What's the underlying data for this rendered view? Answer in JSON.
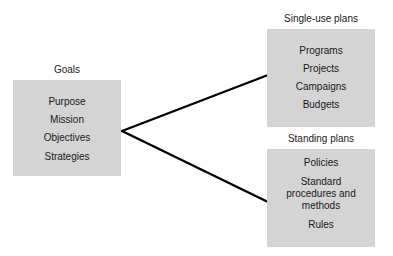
{
  "goals": {
    "title": "Goals",
    "items": [
      "Purpose",
      "Mission",
      "Objectives",
      "Strategies"
    ]
  },
  "single_use": {
    "title": "Single-use plans",
    "items": [
      "Programs",
      "Projects",
      "Campaigns",
      "Budgets"
    ]
  },
  "standing": {
    "title": "Standing plans",
    "items": [
      "Policies",
      "Standard procedures and methods",
      "Rules"
    ],
    "item_lines": {
      "standard_line1": "Standard",
      "standard_line2": "procedures and",
      "standard_line3": "methods"
    }
  },
  "colors": {
    "box_fill": "#d4d4d4",
    "line": "#000000",
    "text": "#1a1a1a"
  }
}
